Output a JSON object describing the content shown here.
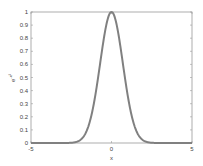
{
  "chart_data": {
    "type": "line",
    "title": "",
    "xlabel": "x",
    "ylabel": "e^{-x^2}",
    "ylabel_base": "e",
    "ylabel_exp": "-x²",
    "xlim": [
      -5,
      5
    ],
    "ylim": [
      0,
      1
    ],
    "x_ticks": [
      -5,
      0,
      5
    ],
    "x_tick_labels": [
      "-5",
      "0",
      "5"
    ],
    "y_ticks": [
      0,
      0.1,
      0.2,
      0.3,
      0.4,
      0.5,
      0.6,
      0.7,
      0.8,
      0.9,
      1
    ],
    "y_tick_labels": [
      "0",
      "0.1",
      "0.2",
      "0.3",
      "0.4",
      "0.5",
      "0.6",
      "0.7",
      "0.8",
      "0.9",
      "1"
    ],
    "grid": false,
    "legend": null,
    "series": [
      {
        "name": "e^{-x^2}",
        "function": "exp(-x^2)",
        "color": "#808080",
        "x": [
          -5,
          -4,
          -3,
          -2.5,
          -2,
          -1.5,
          -1,
          -0.5,
          0,
          0.5,
          1,
          1.5,
          2,
          2.5,
          3,
          4,
          5
        ],
        "values": [
          0.0,
          0.0,
          0.0001,
          0.0019,
          0.0183,
          0.1054,
          0.3679,
          0.7788,
          1.0,
          0.7788,
          0.3679,
          0.1054,
          0.0183,
          0.0019,
          0.0001,
          0.0,
          0.0
        ]
      }
    ]
  },
  "colors": {
    "axis": "#9a9a9a",
    "curve": "#808080",
    "text": "#444444"
  }
}
